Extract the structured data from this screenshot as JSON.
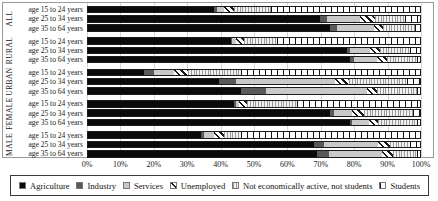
{
  "chart_data": {
    "type": "bar",
    "subtype": "horizontal-stacked-100-percent",
    "title": "",
    "xlabel": "",
    "ylabel": "",
    "x_axis": {
      "min": 0,
      "max": 100,
      "grid": true,
      "ticks": [
        "0%",
        "10%",
        "20%",
        "30%",
        "40%",
        "50%",
        "60%",
        "70%",
        "80%",
        "90%",
        "100%"
      ]
    },
    "legend_position": "bottom",
    "series": [
      {
        "name": "Agriculture",
        "style": "solid-black",
        "color": "#0a0a0a"
      },
      {
        "name": "Industry",
        "style": "solid-dark-gray",
        "color": "#595959"
      },
      {
        "name": "Services",
        "style": "solid-light-gray",
        "color": "#c9c9c9"
      },
      {
        "name": "Unemployed",
        "style": "diagonal-hatch",
        "color": "#1a1a1a"
      },
      {
        "name": "Not economically active, not students",
        "style": "fine-vertical-lines",
        "color": "#9a9a9a"
      },
      {
        "name": "Students",
        "style": "sparse-vertical-lines",
        "color": "#151515"
      }
    ],
    "groups": [
      {
        "name": "ALL",
        "rows": [
          {
            "label": "age 15 to 24 years",
            "values": [
              38,
              1,
              2,
              3,
              11,
              45
            ]
          },
          {
            "label": "age 25 to 34 years",
            "values": [
              70,
              2,
              10,
              4.5,
              9,
              4.5
            ]
          },
          {
            "label": "age 35 to 64 years",
            "values": [
              73,
              2,
              11,
              3,
              9.5,
              1.5
            ]
          }
        ]
      },
      {
        "name": "RURAL",
        "rows": [
          {
            "label": "age 15 to 24 years",
            "values": [
              43,
              0.5,
              1,
              2.5,
              10,
              43
            ]
          },
          {
            "label": "age 25 to 34 years",
            "values": [
              78,
              1,
              6,
              3,
              9,
              3
            ]
          },
          {
            "label": "age 35 to 64 years",
            "values": [
              79,
              1,
              7,
              3,
              9,
              1
            ]
          }
        ]
      },
      {
        "name": "URBAN",
        "rows": [
          {
            "label": "age 15 to 24 years",
            "values": [
              17,
              3,
              6,
              4,
              16,
              54
            ]
          },
          {
            "label": "age 25 to 34 years",
            "values": [
              39.5,
              5,
              30,
              4,
              17.5,
              4
            ]
          },
          {
            "label": "age 35 to 64 years",
            "values": [
              46,
              7.5,
              30.5,
              3,
              12,
              1
            ]
          }
        ]
      },
      {
        "name": "FEMALE",
        "rows": [
          {
            "label": "age 15 to 24 years",
            "values": [
              44,
              0.5,
              1,
              2.5,
              15,
              37
            ]
          },
          {
            "label": "age 25 to 34 years",
            "values": [
              73,
              1,
              5.5,
              3.5,
              15,
              2
            ]
          },
          {
            "label": "age 35 to 64 years",
            "values": [
              79,
              0.5,
              5,
              3,
              11.5,
              1
            ]
          }
        ]
      },
      {
        "name": "MALE",
        "rows": [
          {
            "label": "age 15 to 24 years",
            "values": [
              34,
              1,
              3,
              3,
              5,
              54
            ]
          },
          {
            "label": "age 25 to 34 years",
            "values": [
              68,
              3,
              16.5,
              3.5,
              6,
              3
            ]
          },
          {
            "label": "age 35 to 64 years",
            "values": [
              69,
              3.5,
              16,
              3.5,
              7,
              1
            ]
          }
        ]
      }
    ]
  }
}
